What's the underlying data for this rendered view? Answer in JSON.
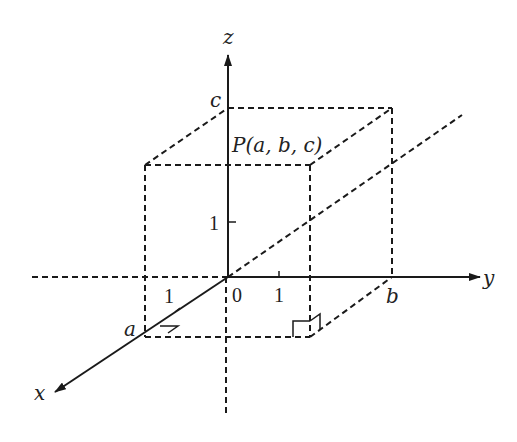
{
  "diagram": {
    "colors": {
      "stroke": "#1a1a1a",
      "background": "#ffffff"
    },
    "axes": {
      "x": {
        "label": "x"
      },
      "y": {
        "label": "y"
      },
      "z": {
        "label": "z"
      }
    },
    "origin_label": "0",
    "ticks": {
      "x_unit": "1",
      "y_unit": "1",
      "z_unit": "1"
    },
    "coordinates": {
      "a": "a",
      "b": "b",
      "c": "c"
    },
    "point_label": "P(a, b, c)"
  }
}
